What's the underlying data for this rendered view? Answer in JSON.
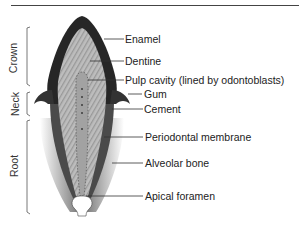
{
  "figure": {
    "regions": [
      {
        "label": "Crown"
      },
      {
        "label": "Neck"
      },
      {
        "label": "Root"
      }
    ],
    "labels": [
      {
        "text": "Enamel"
      },
      {
        "text": "Dentine"
      },
      {
        "text": "Pulp cavity (lined by odontoblasts)"
      },
      {
        "text": "Gum"
      },
      {
        "text": "Cement"
      },
      {
        "text": "Periodontal membrane"
      },
      {
        "text": "Alveolar bone"
      },
      {
        "text": "Apical foramen"
      }
    ],
    "colors": {
      "enamel": "#2a2a2a",
      "dentine": "#b5b5b5",
      "pulp": "#8a8a8a",
      "cement": "#555555",
      "bone": "#7a7a7a",
      "leader": "#333333"
    }
  }
}
